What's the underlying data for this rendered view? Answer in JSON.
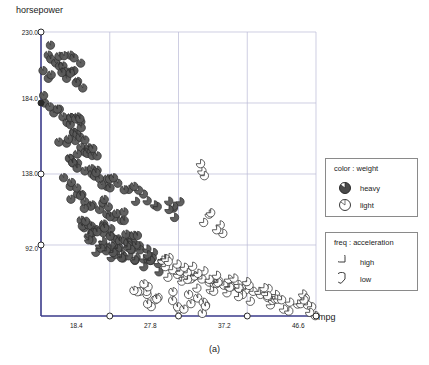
{
  "caption": "(a)",
  "chart_data": {
    "type": "scatter",
    "title": "",
    "xlabel": "mpg",
    "ylabel": "horsepower",
    "xlim": [
      9.0,
      46.6
    ],
    "ylim": [
      46.0,
      230.0
    ],
    "grid": true,
    "xticks": [
      {
        "value": 18.4,
        "label": "18.4"
      },
      {
        "value": 27.8,
        "label": "27.8"
      },
      {
        "value": 37.2,
        "label": "37.2"
      },
      {
        "value": 46.6,
        "label": "46.6"
      }
    ],
    "yticks": [
      {
        "value": 230.0,
        "label": "230.0"
      },
      {
        "value": 184.0,
        "label": "184.0"
      },
      {
        "value": 138.0,
        "label": "138.0"
      },
      {
        "value": 92.0,
        "label": "92.0"
      }
    ],
    "legends": [
      {
        "name": "color-legend",
        "title": "color : weight",
        "entries": [
          {
            "label": "heavy",
            "glyph": "filled-dark-circle",
            "color": "#4a4a4a"
          },
          {
            "label": "light",
            "glyph": "open-circle-small-wedge",
            "color": "#ffffff"
          }
        ]
      },
      {
        "name": "freq-legend",
        "title": "freq : acceleration",
        "entries": [
          {
            "label": "high",
            "glyph": "circle-large-wedge-gap",
            "color": "#ffffff"
          },
          {
            "label": "low",
            "glyph": "circle-small-wedge-gap",
            "color": "#ffffff"
          }
        ]
      }
    ],
    "series": [
      {
        "name": "cars",
        "points": [
          {
            "x": 10.0,
            "y": 215,
            "w": "heavy",
            "a": "low"
          },
          {
            "x": 10.0,
            "y": 200,
            "w": "heavy",
            "a": "low"
          },
          {
            "x": 11.0,
            "y": 210,
            "w": "heavy",
            "a": "low"
          },
          {
            "x": 12.0,
            "y": 208,
            "w": "heavy",
            "a": "low"
          },
          {
            "x": 12.5,
            "y": 200,
            "w": "heavy",
            "a": "low"
          },
          {
            "x": 13.0,
            "y": 215,
            "w": "heavy",
            "a": "low"
          },
          {
            "x": 13.5,
            "y": 205,
            "w": "heavy",
            "a": "low"
          },
          {
            "x": 14.0,
            "y": 198,
            "w": "heavy",
            "a": "low"
          },
          {
            "x": 11.5,
            "y": 180,
            "w": "heavy",
            "a": "low"
          },
          {
            "x": 12.0,
            "y": 175,
            "w": "heavy",
            "a": "low"
          },
          {
            "x": 9.5,
            "y": 184,
            "w": "heavy",
            "a": "low"
          },
          {
            "x": 13.0,
            "y": 170,
            "w": "heavy",
            "a": "low"
          },
          {
            "x": 13.5,
            "y": 165,
            "w": "heavy",
            "a": "low"
          },
          {
            "x": 14.0,
            "y": 175,
            "w": "heavy",
            "a": "low"
          },
          {
            "x": 14.5,
            "y": 168,
            "w": "heavy",
            "a": "low"
          },
          {
            "x": 15.0,
            "y": 160,
            "w": "heavy",
            "a": "low"
          },
          {
            "x": 15.5,
            "y": 155,
            "w": "heavy",
            "a": "low"
          },
          {
            "x": 16.0,
            "y": 150,
            "w": "heavy",
            "a": "low"
          },
          {
            "x": 12.5,
            "y": 158,
            "w": "heavy",
            "a": "low"
          },
          {
            "x": 13.0,
            "y": 148,
            "w": "heavy",
            "a": "low"
          },
          {
            "x": 14.0,
            "y": 145,
            "w": "heavy",
            "a": "low"
          },
          {
            "x": 15.0,
            "y": 140,
            "w": "heavy",
            "a": "low"
          },
          {
            "x": 16.0,
            "y": 138,
            "w": "heavy",
            "a": "low"
          },
          {
            "x": 17.0,
            "y": 135,
            "w": "heavy",
            "a": "low"
          },
          {
            "x": 18.0,
            "y": 130,
            "w": "heavy",
            "a": "low"
          },
          {
            "x": 13.0,
            "y": 130,
            "w": "heavy",
            "a": "low"
          },
          {
            "x": 14.0,
            "y": 125,
            "w": "heavy",
            "a": "low"
          },
          {
            "x": 15.0,
            "y": 120,
            "w": "heavy",
            "a": "low"
          },
          {
            "x": 16.0,
            "y": 118,
            "w": "heavy",
            "a": "low"
          },
          {
            "x": 17.0,
            "y": 115,
            "w": "heavy",
            "a": "low"
          },
          {
            "x": 18.0,
            "y": 112,
            "w": "heavy",
            "a": "low"
          },
          {
            "x": 19.0,
            "y": 110,
            "w": "heavy",
            "a": "low"
          },
          {
            "x": 20.0,
            "y": 108,
            "w": "heavy",
            "a": "low"
          },
          {
            "x": 14.5,
            "y": 108,
            "w": "heavy",
            "a": "low"
          },
          {
            "x": 15.5,
            "y": 105,
            "w": "heavy",
            "a": "low"
          },
          {
            "x": 16.5,
            "y": 102,
            "w": "heavy",
            "a": "low"
          },
          {
            "x": 17.5,
            "y": 100,
            "w": "heavy",
            "a": "low"
          },
          {
            "x": 18.5,
            "y": 98,
            "w": "heavy",
            "a": "low"
          },
          {
            "x": 19.5,
            "y": 96,
            "w": "heavy",
            "a": "low"
          },
          {
            "x": 20.5,
            "y": 95,
            "w": "heavy",
            "a": "low"
          },
          {
            "x": 21.5,
            "y": 94,
            "w": "heavy",
            "a": "low"
          },
          {
            "x": 22.0,
            "y": 92,
            "w": "heavy",
            "a": "low"
          },
          {
            "x": 16.0,
            "y": 95,
            "w": "heavy",
            "a": "high"
          },
          {
            "x": 17.0,
            "y": 92,
            "w": "heavy",
            "a": "high"
          },
          {
            "x": 18.0,
            "y": 90,
            "w": "heavy",
            "a": "high"
          },
          {
            "x": 19.0,
            "y": 88,
            "w": "heavy",
            "a": "high"
          },
          {
            "x": 20.0,
            "y": 86,
            "w": "heavy",
            "a": "high"
          },
          {
            "x": 21.0,
            "y": 85,
            "w": "heavy",
            "a": "high"
          },
          {
            "x": 22.0,
            "y": 84,
            "w": "heavy",
            "a": "high"
          },
          {
            "x": 23.0,
            "y": 83,
            "w": "heavy",
            "a": "high"
          },
          {
            "x": 24.0,
            "y": 82,
            "w": "heavy",
            "a": "high"
          },
          {
            "x": 25.0,
            "y": 80,
            "w": "heavy",
            "a": "high"
          },
          {
            "x": 26.0,
            "y": 78,
            "w": "light",
            "a": "high"
          },
          {
            "x": 27.0,
            "y": 76,
            "w": "light",
            "a": "high"
          },
          {
            "x": 28.0,
            "y": 75,
            "w": "light",
            "a": "high"
          },
          {
            "x": 29.0,
            "y": 74,
            "w": "light",
            "a": "high"
          },
          {
            "x": 30.0,
            "y": 72,
            "w": "light",
            "a": "high"
          },
          {
            "x": 31.0,
            "y": 70,
            "w": "light",
            "a": "high"
          },
          {
            "x": 32.0,
            "y": 68,
            "w": "light",
            "a": "high"
          },
          {
            "x": 33.0,
            "y": 67,
            "w": "light",
            "a": "high"
          },
          {
            "x": 34.0,
            "y": 66,
            "w": "light",
            "a": "high"
          },
          {
            "x": 35.0,
            "y": 65,
            "w": "light",
            "a": "high"
          },
          {
            "x": 36.0,
            "y": 64,
            "w": "light",
            "a": "high"
          },
          {
            "x": 37.0,
            "y": 63,
            "w": "light",
            "a": "high"
          },
          {
            "x": 38.0,
            "y": 62,
            "w": "light",
            "a": "high"
          },
          {
            "x": 39.0,
            "y": 60,
            "w": "light",
            "a": "high"
          },
          {
            "x": 40.0,
            "y": 58,
            "w": "light",
            "a": "high"
          },
          {
            "x": 41.0,
            "y": 57,
            "w": "light",
            "a": "high"
          },
          {
            "x": 43.0,
            "y": 55,
            "w": "light",
            "a": "high"
          },
          {
            "x": 44.5,
            "y": 54,
            "w": "light",
            "a": "high"
          },
          {
            "x": 46.0,
            "y": 52,
            "w": "light",
            "a": "high"
          },
          {
            "x": 31.0,
            "y": 140,
            "w": "light",
            "a": "high"
          },
          {
            "x": 32.0,
            "y": 112,
            "w": "light",
            "a": "high"
          },
          {
            "x": 33.5,
            "y": 105,
            "w": "light",
            "a": "high"
          },
          {
            "x": 28.0,
            "y": 120,
            "w": "heavy",
            "a": "high"
          },
          {
            "x": 26.5,
            "y": 115,
            "w": "heavy",
            "a": "high"
          },
          {
            "x": 24.5,
            "y": 118,
            "w": "heavy",
            "a": "high"
          },
          {
            "x": 23.0,
            "y": 125,
            "w": "heavy",
            "a": "high"
          },
          {
            "x": 21.0,
            "y": 128,
            "w": "heavy",
            "a": "low"
          },
          {
            "x": 19.5,
            "y": 132,
            "w": "heavy",
            "a": "low"
          },
          {
            "x": 25.0,
            "y": 58,
            "w": "light",
            "a": "low"
          },
          {
            "x": 27.0,
            "y": 56,
            "w": "light",
            "a": "low"
          },
          {
            "x": 29.5,
            "y": 54,
            "w": "light",
            "a": "low"
          },
          {
            "x": 31.5,
            "y": 53,
            "w": "light",
            "a": "low"
          },
          {
            "x": 23.5,
            "y": 60,
            "w": "light",
            "a": "low"
          },
          {
            "x": 22.5,
            "y": 62,
            "w": "light",
            "a": "low"
          }
        ]
      }
    ]
  }
}
